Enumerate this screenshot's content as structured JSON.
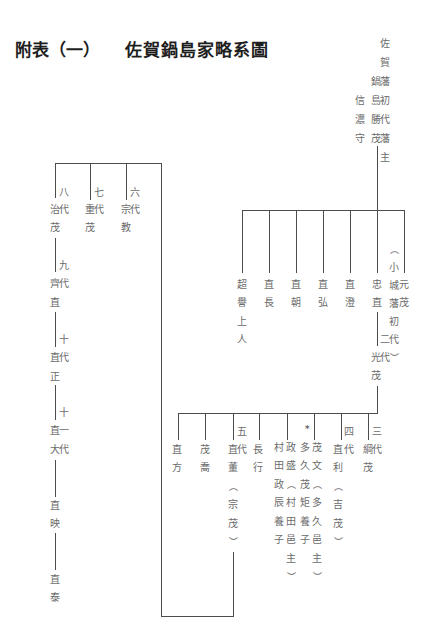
{
  "page": {
    "title_label": "附表（一）",
    "title_text": "佐賀鍋島家略系圖"
  },
  "tree": {
    "founder": {
      "title": "佐賀藩初代藩主",
      "name": "鍋島勝茂",
      "office": "信濃守"
    },
    "founder_children": [
      {
        "name": "超譽上人"
      },
      {
        "name": "直長"
      },
      {
        "name": "直朝"
      },
      {
        "name": "直弘"
      },
      {
        "name": "直澄"
      },
      {
        "name": "忠直"
      },
      {
        "name": "元茂",
        "note": "︵小城藩初代︶"
      }
    ],
    "second_lord": {
      "generation": "二代",
      "name": "光茂"
    },
    "second_lord_children": [
      {
        "name": "直方"
      },
      {
        "name": "茂喬"
      },
      {
        "generation": "五代",
        "name": "直董︵宗茂︶"
      },
      {
        "name": "長行"
      },
      {
        "name": "政盛︵村田邑主︶",
        "note": "村田政辰養子"
      },
      {
        "mark": "*",
        "name": "茂文︵多久邑主︶",
        "note": "多久茂矩養子"
      },
      {
        "generation": "四代",
        "name": "直利︵吉茂︶"
      },
      {
        "generation": "三代",
        "name": "綱茂"
      }
    ],
    "fifth_lord_children": [
      {
        "generation": "八代",
        "name": "治茂"
      },
      {
        "generation": "七代",
        "name": "重茂"
      },
      {
        "generation": "六代",
        "name": "宗教"
      }
    ],
    "main_line": [
      {
        "generation": "九代",
        "name": "齊直"
      },
      {
        "generation": "十代",
        "name": "直正"
      },
      {
        "generation": "十一代",
        "name": "直大"
      },
      {
        "name": "直映"
      },
      {
        "name": "直泰"
      }
    ]
  },
  "colors": {
    "title": "#1e1e1e",
    "text": "#6b6b6b",
    "line": "#4d4d4d",
    "background": "#ffffff"
  }
}
